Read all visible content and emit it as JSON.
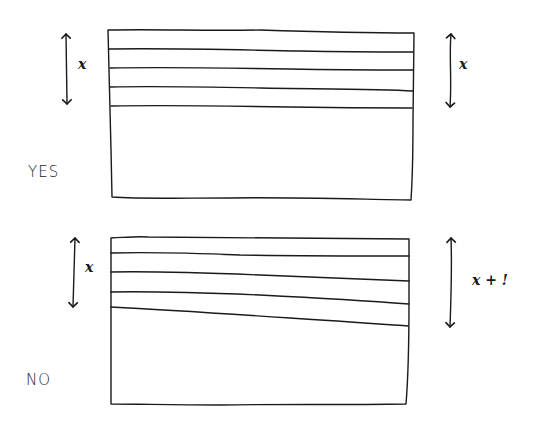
{
  "diagrams": [
    {
      "verdict": "YES",
      "left_label": "x",
      "right_label": "x",
      "box": {
        "x1": 108,
        "y1": 30,
        "x2": 414,
        "y2": 200
      },
      "layer_lines_left_y": [
        49,
        68,
        87,
        106
      ],
      "layer_lines_right_y": [
        52,
        70,
        91,
        108
      ]
    },
    {
      "verdict": "NO",
      "left_label": "x",
      "right_label": "x + !",
      "box": {
        "x1": 110,
        "y1": 238,
        "x2": 408,
        "y2": 404
      },
      "layer_lines_left_y": [
        253,
        272,
        292,
        307
      ],
      "layer_lines_right_y": [
        256,
        281,
        304,
        326
      ]
    }
  ],
  "colors": {
    "ink": "#1a1a1a",
    "background": "#ffffff"
  }
}
